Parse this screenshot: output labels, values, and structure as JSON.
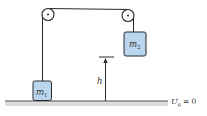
{
  "diagram": {
    "type": "atwood-machine-potential-energy",
    "masses": [
      {
        "id": "m1",
        "symbol": "m",
        "subscript": "1",
        "position": "on ground, left"
      },
      {
        "id": "m2",
        "symbol": "m",
        "subscript": "2",
        "position": "raised, right"
      }
    ],
    "height_label": "h",
    "reference_label": {
      "symbol": "U",
      "subscript": "g",
      "equals": "= 0"
    },
    "colors": {
      "block_fill": "#b9d6ee",
      "block_stroke": "#2a2a2a",
      "rope": "#2a2a2a",
      "ground_line": "#555555",
      "ground_shade": "#d8d8d8",
      "text": "#333333"
    }
  }
}
